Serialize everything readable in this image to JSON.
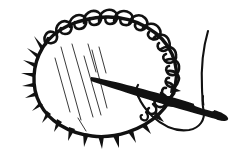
{
  "image": {
    "title": "Threaded needle working blanket stitch around a round fabric disc",
    "kind": "line-art-illustration",
    "style": "black ink drawing on white background",
    "width": 243,
    "height": 152,
    "background_color": "#ffffff",
    "ink_color": "#111111",
    "hatch_color": "#3a3a3a"
  },
  "objects": {
    "disc": {
      "name": "round fabric disc",
      "center_x": 107,
      "center_y": 79,
      "radius_x": 72,
      "radius_y": 62,
      "outline_stroke_width": 3.2
    },
    "loop_stitches": {
      "name": "blanket stitch loops",
      "count": 14,
      "arc_start_degrees": 205,
      "arc_end_degrees": 12,
      "description": "closed curled loops riding along the top and upper-right rim"
    },
    "spikes": {
      "name": "stitch spikes",
      "count": 17,
      "arc_start_degrees": 15,
      "arc_end_degrees": 195,
      "description": "short triangular tick marks radiating outward along the left and lower rim"
    },
    "hatching": {
      "name": "shading hatch lines",
      "count": 8,
      "direction": "upper-left to lower-right diagonal",
      "description": "thin parallel strokes suggesting fabric sheen inside the disc"
    },
    "needle": {
      "name": "sewing needle",
      "tip_x": 91,
      "tip_y": 77,
      "butt_x": 222,
      "butt_y": 113,
      "eye_x": 201,
      "eye_y": 105,
      "description": "dark tapered needle angled down-right, piercing the disc rim"
    },
    "thread": {
      "name": "thread",
      "tail_top_x": 208,
      "tail_top_y": 31,
      "loop_bottom_x": 183,
      "loop_bottom_y": 128,
      "description": "thread rises from the eye to the upper right and loops back under the needle to the left"
    }
  },
  "labels": {
    "alt_text": "A hand-drawn illustration of a circular piece of fabric edged with blanket stitches, pierced by a threaded sewing needle.",
    "caption": ""
  }
}
